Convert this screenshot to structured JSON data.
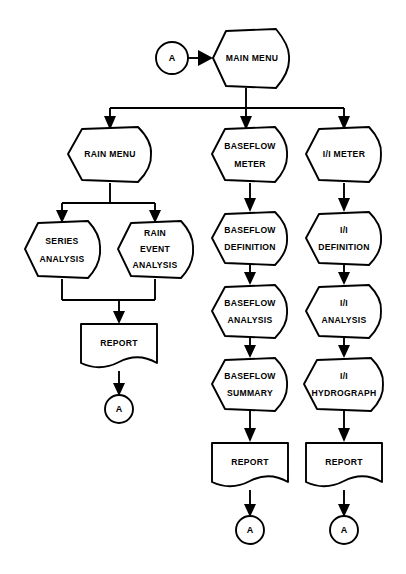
{
  "diagram": {
    "background_color": "#ffffff",
    "line_color": "#000000",
    "fill_color": "#ffffff"
  },
  "nodes": [
    {
      "id": "conn_a_top",
      "label": "A",
      "shape": "connector",
      "cx": 172,
      "cy": 58,
      "r": 16
    },
    {
      "id": "main_menu",
      "label": "MAIN MENU",
      "shape": "process",
      "cx": 246,
      "cy": 58,
      "w": 82,
      "h": 58
    },
    {
      "id": "rain_menu",
      "label": "RAIN MENU",
      "shape": "process",
      "cx": 110,
      "cy": 154,
      "w": 84,
      "h": 54
    },
    {
      "id": "baseflow_meter",
      "label": "BASEFLOW METER",
      "shape": "process",
      "cx": 250,
      "cy": 154,
      "w": 76,
      "h": 54
    },
    {
      "id": "ii_meter",
      "label": "I/I METER",
      "shape": "process",
      "cx": 344,
      "cy": 154,
      "w": 76,
      "h": 54
    },
    {
      "id": "series_analysis",
      "label": "SERIES ANALYSIS",
      "shape": "process",
      "cx": 62,
      "cy": 249,
      "w": 74,
      "h": 58
    },
    {
      "id": "rain_event_analysis",
      "label": "RAIN EVENT ANALYSIS",
      "shape": "process",
      "cx": 155,
      "cy": 249,
      "w": 74,
      "h": 58
    },
    {
      "id": "baseflow_definition",
      "label": "BASEFLOW DEFINITION",
      "shape": "process",
      "cx": 250,
      "cy": 238,
      "w": 76,
      "h": 52
    },
    {
      "id": "ii_definition",
      "label": "I/I DEFINITION",
      "shape": "process",
      "cx": 344,
      "cy": 238,
      "w": 76,
      "h": 52
    },
    {
      "id": "baseflow_analysis",
      "label": "BASEFLOW ANALYSIS",
      "shape": "process",
      "cx": 250,
      "cy": 311,
      "w": 76,
      "h": 52
    },
    {
      "id": "ii_analysis",
      "label": "I/I ANALYSIS",
      "shape": "process",
      "cx": 344,
      "cy": 311,
      "w": 76,
      "h": 52
    },
    {
      "id": "baseflow_summary",
      "label": "BASEFLOW SUMMARY",
      "shape": "process",
      "cx": 250,
      "cy": 384,
      "w": 76,
      "h": 52
    },
    {
      "id": "ii_hydrograph",
      "label": "I/I HYDROGRAPH",
      "shape": "process",
      "cx": 344,
      "cy": 384,
      "w": 76,
      "h": 52
    },
    {
      "id": "report_left",
      "label": "REPORT",
      "shape": "document",
      "cx": 119,
      "cy": 347,
      "w": 76,
      "h": 48
    },
    {
      "id": "report_mid",
      "label": "REPORT",
      "shape": "document",
      "cx": 250,
      "cy": 466,
      "w": 76,
      "h": 48
    },
    {
      "id": "report_right",
      "label": "REPORT",
      "shape": "document",
      "cx": 344,
      "cy": 466,
      "w": 76,
      "h": 48
    },
    {
      "id": "conn_a_left",
      "label": "A",
      "shape": "connector",
      "cx": 119,
      "cy": 409,
      "r": 14
    },
    {
      "id": "conn_a_mid",
      "label": "A",
      "shape": "connector",
      "cx": 250,
      "cy": 530,
      "r": 14
    },
    {
      "id": "conn_a_right",
      "label": "A",
      "shape": "connector",
      "cx": 344,
      "cy": 530,
      "r": 14
    }
  ],
  "edges": [
    {
      "from": "conn_a_top",
      "to": "main_menu",
      "kind": "arrow-right"
    },
    {
      "from": "main_menu",
      "to": "bus_top",
      "kind": "split-bus"
    },
    {
      "from": "bus_top",
      "to": "rain_menu",
      "kind": "arrow-down"
    },
    {
      "from": "bus_top",
      "to": "baseflow_meter",
      "kind": "arrow-down"
    },
    {
      "from": "bus_top",
      "to": "ii_meter",
      "kind": "arrow-down"
    },
    {
      "from": "rain_menu",
      "to": "bus_rain",
      "kind": "split-bus"
    },
    {
      "from": "bus_rain",
      "to": "series_analysis",
      "kind": "arrow-down"
    },
    {
      "from": "bus_rain",
      "to": "rain_event_analysis",
      "kind": "arrow-down"
    },
    {
      "from": "series_analysis",
      "to": "merge_rain",
      "kind": "merge-bus"
    },
    {
      "from": "rain_event_analysis",
      "to": "merge_rain",
      "kind": "merge-bus"
    },
    {
      "from": "merge_rain",
      "to": "report_left",
      "kind": "arrow-down"
    },
    {
      "from": "report_left",
      "to": "conn_a_left",
      "kind": "arrow-down"
    },
    {
      "from": "baseflow_meter",
      "to": "baseflow_definition",
      "kind": "arrow-down"
    },
    {
      "from": "baseflow_definition",
      "to": "baseflow_analysis",
      "kind": "arrow-down"
    },
    {
      "from": "baseflow_analysis",
      "to": "baseflow_summary",
      "kind": "arrow-down"
    },
    {
      "from": "baseflow_summary",
      "to": "report_mid",
      "kind": "arrow-down"
    },
    {
      "from": "report_mid",
      "to": "conn_a_mid",
      "kind": "arrow-down"
    },
    {
      "from": "ii_meter",
      "to": "ii_definition",
      "kind": "arrow-down"
    },
    {
      "from": "ii_definition",
      "to": "ii_analysis",
      "kind": "arrow-down"
    },
    {
      "from": "ii_analysis",
      "to": "ii_hydrograph",
      "kind": "arrow-down"
    },
    {
      "from": "ii_hydrograph",
      "to": "report_right",
      "kind": "arrow-down"
    },
    {
      "from": "report_right",
      "to": "conn_a_right",
      "kind": "arrow-down"
    }
  ],
  "labels": {
    "conn_a_top": "A",
    "main_menu": "MAIN MENU",
    "rain_menu": "RAIN MENU",
    "baseflow_meter_1": "BASEFLOW",
    "baseflow_meter_2": "METER",
    "ii_meter": "I/I METER",
    "series_analysis_1": "SERIES",
    "series_analysis_2": "ANALYSIS",
    "rain_event_1": "RAIN",
    "rain_event_2": "EVENT",
    "rain_event_3": "ANALYSIS",
    "baseflow_definition_1": "BASEFLOW",
    "baseflow_definition_2": "DEFINITION",
    "ii_definition_1": "I/I",
    "ii_definition_2": "DEFINITION",
    "baseflow_analysis_1": "BASEFLOW",
    "baseflow_analysis_2": "ANALYSIS",
    "ii_analysis_1": "I/I",
    "ii_analysis_2": "ANALYSIS",
    "baseflow_summary_1": "BASEFLOW",
    "baseflow_summary_2": "SUMMARY",
    "ii_hydrograph_1": "I/I",
    "ii_hydrograph_2": "HYDROGRAPH",
    "report_left": "REPORT",
    "report_mid": "REPORT",
    "report_right": "REPORT",
    "conn_a_left": "A",
    "conn_a_mid": "A",
    "conn_a_right": "A"
  }
}
